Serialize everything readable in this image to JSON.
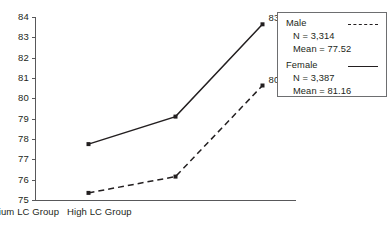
{
  "chart_data": {
    "type": "line",
    "title": "",
    "xlabel": "",
    "ylabel": "",
    "categories": [
      "Low LC Group",
      "Medium LC Group",
      "High LC Group"
    ],
    "ylim": [
      75,
      84
    ],
    "yticks": [
      75,
      76,
      77,
      78,
      79,
      80,
      81,
      82,
      83,
      84
    ],
    "grid": false,
    "legend_position": "top-right",
    "series": [
      {
        "name": "Male",
        "style": "dashed",
        "values": [
          75.35,
          76.15,
          80.63
        ],
        "n": "N = 3,314",
        "mean": "Mean = 77.52",
        "point_labels": [
          "",
          "",
          "80.63"
        ]
      },
      {
        "name": "Female",
        "style": "solid",
        "values": [
          77.75,
          79.1,
          83.64
        ],
        "n": "N = 3,387",
        "mean": "Mean = 81.16",
        "point_labels": [
          "",
          "",
          "83.64"
        ]
      }
    ]
  },
  "axis": {
    "ytick_labels": [
      "84",
      "83",
      "82",
      "81",
      "80",
      "79",
      "78",
      "77",
      "76",
      "75"
    ],
    "xtick_labels": [
      "Low LC Group",
      "Medium LC Group",
      "High LC Group"
    ]
  },
  "legend": {
    "male_name": "Male",
    "male_n": "N = 3,314",
    "male_mean": "Mean = 77.52",
    "female_name": "Female",
    "female_n": "N = 3,387",
    "female_mean": "Mean = 81.16"
  },
  "annotations": {
    "female_high": "83.64",
    "male_high": "80.63"
  },
  "colors": {
    "line": "#231f20",
    "axis": "#58585a",
    "legend_border": "#6d6e70",
    "background": "#ffffff"
  }
}
